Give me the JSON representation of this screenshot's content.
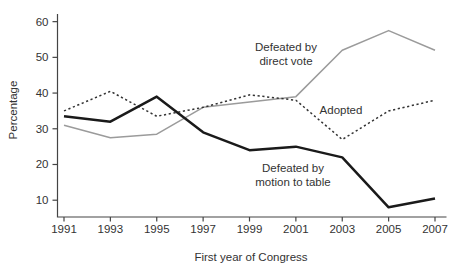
{
  "chart_data": {
    "type": "line",
    "title": "",
    "xlabel": "First year of Congress",
    "ylabel": "Percentage",
    "categories": [
      "1991",
      "1993",
      "1995",
      "1997",
      "1999",
      "2001",
      "2003",
      "2005",
      "2007"
    ],
    "y_ticks": [
      10,
      20,
      30,
      40,
      50,
      60
    ],
    "ylim": [
      5,
      62
    ],
    "grid": false,
    "legend_position": "inline-annotations",
    "colors": {
      "direct_vote_line": "#9b9b9b",
      "adopted_line": "#333333",
      "motion_to_table_line": "#1a1a1a",
      "axis": "#444444",
      "text": "#333333"
    },
    "series": [
      {
        "name": "Defeated by direct vote",
        "style": "solid",
        "color": "#9b9b9b",
        "width": 1.5,
        "values": [
          31,
          27.5,
          28.5,
          36,
          37.5,
          39,
          52,
          57.5,
          52
        ]
      },
      {
        "name": "Adopted",
        "style": "dotted",
        "color": "#333333",
        "width": 1.5,
        "values": [
          35,
          40.5,
          33.5,
          36,
          39.5,
          38,
          27,
          35,
          38
        ]
      },
      {
        "name": "Defeated by motion to table",
        "style": "solid",
        "color": "#1a1a1a",
        "width": 2.5,
        "values": [
          33.5,
          32,
          39,
          29,
          24,
          25,
          22,
          8,
          10.5
        ]
      }
    ],
    "annotations": [
      {
        "lines": [
          "Defeated by",
          "direct vote"
        ],
        "x": 286,
        "y": 51
      },
      {
        "lines": [
          "Adopted"
        ],
        "x": 341,
        "y": 114
      },
      {
        "lines": [
          "Defeated by",
          "motion to table"
        ],
        "x": 293,
        "y": 172
      }
    ]
  }
}
